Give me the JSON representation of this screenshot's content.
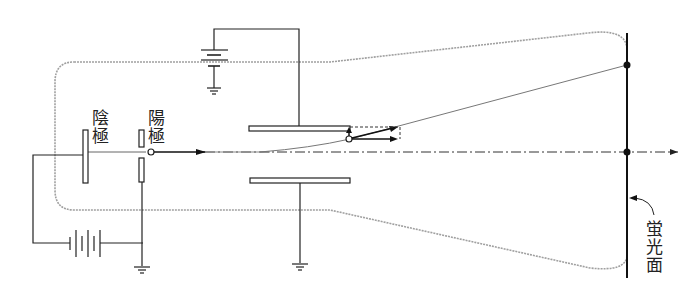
{
  "diagram": {
    "labels": {
      "cathode": "陰極",
      "anode": "陽極",
      "screen": "蛍光面"
    },
    "colors": {
      "line": "#222222",
      "tube_outline": "#9a9a9a",
      "background": "#ffffff"
    },
    "components": [
      {
        "name": "cathode",
        "label": "陰極"
      },
      {
        "name": "anode",
        "label": "陽極"
      },
      {
        "name": "deflection-plates",
        "count": 2
      },
      {
        "name": "deflection-battery"
      },
      {
        "name": "accelerating-battery"
      },
      {
        "name": "fluorescent-screen",
        "label": "蛍光面"
      },
      {
        "name": "ground",
        "count": 3
      }
    ]
  }
}
